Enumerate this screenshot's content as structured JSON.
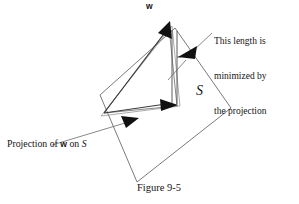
{
  "figure": {
    "caption": "Figure 9-5",
    "vector_label": "w",
    "plane_label": "S",
    "callout": {
      "line1": "This length is",
      "line2": "minimized by",
      "line3": "the projection"
    },
    "projection_caption": {
      "prefix": "Projection of ",
      "vector": "w",
      "middle": " on ",
      "plane": "S"
    },
    "colors": {
      "ink": "#141414",
      "line": "#5a5a5a",
      "arrow_fill": "#111111",
      "background": "#ffffff"
    },
    "geometry": {
      "plane_polygon": "100,95 175,28 231,108 137,182",
      "vector_origin": "104,113",
      "vector_tip": "168,26",
      "projection_tip": "176,105",
      "bracket_top": "174,30",
      "bracket_bottom": "174,102"
    }
  }
}
